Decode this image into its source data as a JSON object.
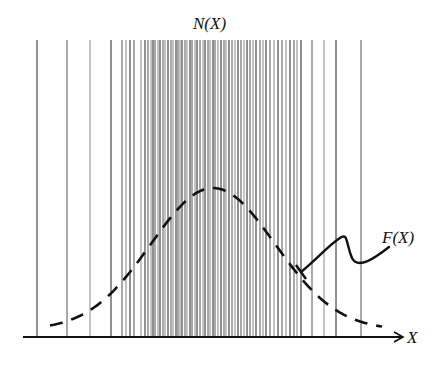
{
  "diagram": {
    "title": "N(X)",
    "curve_label": "F(X)",
    "axis_label": "X",
    "colors": {
      "background": "#ffffff",
      "lines": "#333333",
      "curve": "#111111",
      "axis": "#111111"
    },
    "axis": {
      "y": 337,
      "x_start": 23,
      "x_end": 403
    },
    "line_top": 40,
    "vertical_lines_x": [
      37,
      67,
      90,
      111,
      122,
      126,
      130,
      134,
      141,
      145,
      148,
      151,
      153,
      155,
      158,
      160,
      163,
      165,
      168,
      171,
      173,
      176,
      178,
      180,
      182,
      185,
      187,
      190,
      192,
      195,
      197,
      200,
      203,
      205,
      208,
      210,
      213,
      215,
      218,
      221,
      224,
      226,
      229,
      232,
      235,
      238,
      241,
      244,
      247,
      250,
      253,
      256,
      260,
      263,
      266,
      270,
      274,
      278,
      282,
      286,
      290,
      294,
      297,
      301,
      312,
      324,
      336,
      361
    ],
    "gaussian": {
      "x_start": 50,
      "x_end": 382,
      "peak_x": 213,
      "peak_y": 188,
      "baseline_y": 330
    },
    "annotation": {
      "arrow_from": [
        389,
        247
      ],
      "arrow_to": [
        301,
        272
      ]
    }
  }
}
